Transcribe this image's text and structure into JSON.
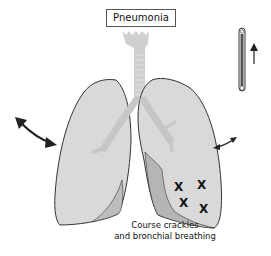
{
  "title": "Pneumonia",
  "caption": {
    "line1": "Course crackles",
    "line2": "and bronchial breathing"
  },
  "markers": {
    "symbol": "X",
    "count": 4
  },
  "indicators": {
    "left_chest_movement": "double-arrow-large",
    "right_chest_movement": "double-arrow-small",
    "thermometer": "thermometer-icon",
    "temperature_trend": "up-arrow"
  },
  "colors": {
    "lung_fill": "#d9d9d9",
    "consolidation_fill": "#b5b5b5",
    "airway": "#c6c6c6",
    "outline": "#333333",
    "text": "#111111"
  }
}
